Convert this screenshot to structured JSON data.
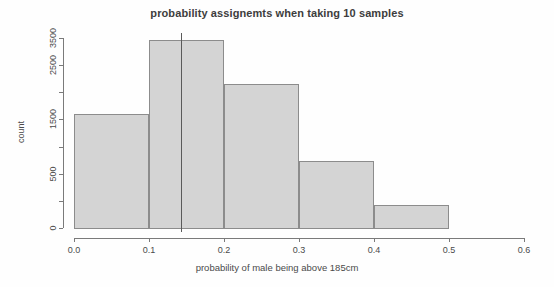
{
  "chart_data": {
    "type": "bar",
    "title": "probability assignemts when taking 10 samples",
    "xlabel": "probability of male being above 185cm",
    "ylabel": "count",
    "subtitle": "",
    "grid": false,
    "legend": "none",
    "xlim": [
      0.0,
      0.6
    ],
    "ylim": [
      0,
      3600
    ],
    "xticks": [
      "0.0",
      "0.1",
      "0.2",
      "0.3",
      "0.4",
      "0.5",
      "0.6"
    ],
    "xtick_values": [
      0.0,
      0.1,
      0.2,
      0.3,
      0.4,
      0.5,
      0.6
    ],
    "yticks": [
      "0",
      "500",
      "1500",
      "2500",
      "3500"
    ],
    "ytick_values": [
      0,
      500,
      1500,
      2500,
      3500
    ],
    "yminor_values": [
      1000,
      2000,
      3000
    ],
    "bin_edges": [
      0.0,
      0.1,
      0.2,
      0.3,
      0.4,
      0.5
    ],
    "categories": [
      "0.0-0.1",
      "0.1-0.2",
      "0.2-0.3",
      "0.3-0.4",
      "0.4-0.5"
    ],
    "values": [
      2100,
      3460,
      2650,
      1250,
      440
    ],
    "bar_fill_color": "#d4d4d4",
    "bar_border_color": "#8c8c8c",
    "annotations": [
      {
        "name": "reference-line",
        "orientation": "vertical",
        "x": 0.143,
        "color": "#5a5a5a"
      }
    ]
  }
}
